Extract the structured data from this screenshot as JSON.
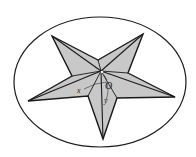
{
  "diagram": {
    "colors": {
      "background": "#ffffff",
      "star_fill": "#c8c8c8",
      "stroke": "#1a1a1a"
    },
    "ellipse": {
      "cx": 100,
      "cy": 82,
      "rx": 86,
      "ry": 65
    },
    "apex": {
      "x": 101,
      "y": 71
    },
    "outer_tips": [
      {
        "name": "top-left",
        "x": 52,
        "y": 36
      },
      {
        "name": "top-right",
        "x": 143,
        "y": 34
      },
      {
        "name": "right",
        "x": 175,
        "y": 97
      },
      {
        "name": "bottom",
        "x": 103,
        "y": 139
      },
      {
        "name": "left",
        "x": 28,
        "y": 101
      }
    ],
    "inner_vertices": [
      {
        "name": "top",
        "x": 98,
        "y": 60
      },
      {
        "name": "right-upper",
        "x": 128,
        "y": 73
      },
      {
        "name": "right-lower",
        "x": 117,
        "y": 98
      },
      {
        "name": "left-lower",
        "x": 88,
        "y": 96
      },
      {
        "name": "left-upper",
        "x": 72,
        "y": 76
      }
    ],
    "labels": {
      "origin": "O",
      "x_axis": "x",
      "y_axis": "y"
    }
  }
}
